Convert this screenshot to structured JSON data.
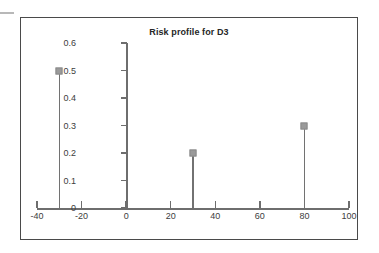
{
  "chart_data": {
    "type": "scatter",
    "title": "Risk profile for D3",
    "xlabel": "",
    "ylabel": "",
    "xlim": [
      -40,
      100
    ],
    "ylim": [
      0,
      0.6
    ],
    "grid": false,
    "legend": null,
    "x_ticks": [
      -40,
      -20,
      0,
      20,
      40,
      60,
      80,
      100
    ],
    "x_tick_labels": [
      "-40",
      "-20",
      "0",
      "20",
      "40",
      "60",
      "80",
      "100"
    ],
    "y_ticks": [
      0,
      0.1,
      0.2,
      0.3,
      0.4,
      0.5,
      0.6
    ],
    "y_tick_labels": [
      "0",
      "0.1",
      "0.2",
      "0.3",
      "0.4",
      "0.5",
      "0.6"
    ],
    "x": [
      -30,
      30,
      80
    ],
    "values": [
      0.5,
      0.2,
      0.3
    ],
    "points": [
      {
        "x": -30,
        "y": 0.5
      },
      {
        "x": 30,
        "y": 0.2
      },
      {
        "x": 80,
        "y": 0.3
      }
    ],
    "marker_style": "square-dot",
    "stem_plot": true
  },
  "colors": {
    "frame": "#4a4a4a",
    "axis": "#6e6e6e",
    "marker": "#9a9a9a",
    "stem": "#727272",
    "text": "#3d3d3d",
    "title": "#262626",
    "background": "#ffffff"
  }
}
